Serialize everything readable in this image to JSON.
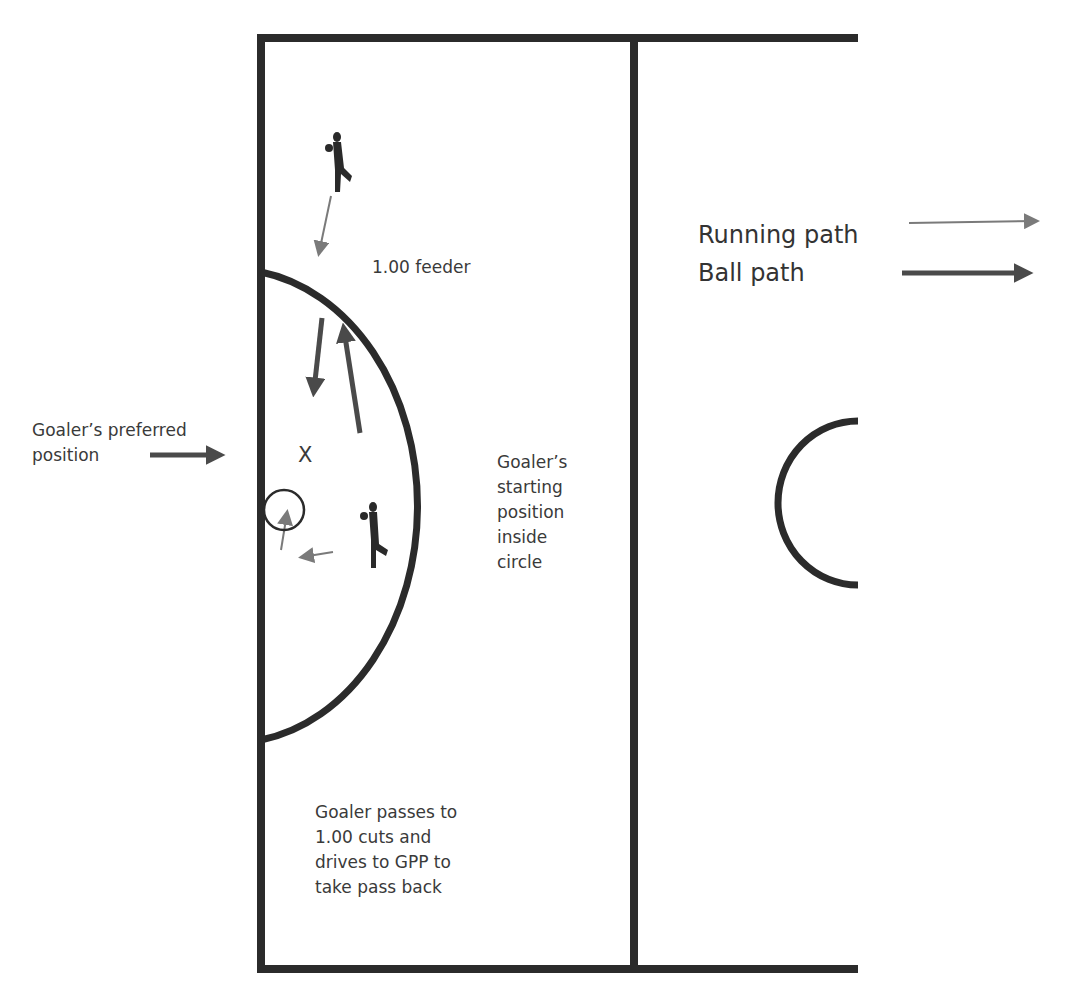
{
  "diagram": {
    "colors": {
      "line": "#2b2b2b",
      "ball_path": "#4a4a4a",
      "running_path": "#7a7a7a",
      "text": "#3a3a3a"
    },
    "labels": {
      "feeder": "1.00 feeder",
      "preferred_position": "Goaler’s preferred\nposition",
      "starting_position": "Goaler’s\nstarting\nposition\n inside\ncircle",
      "description": "Goaler passes to\n1.00 cuts and\ndrives to GPP to\ntake pass back",
      "marker_x": "X"
    },
    "legend": {
      "running_path": "Running path",
      "ball_path": "Ball path"
    }
  }
}
